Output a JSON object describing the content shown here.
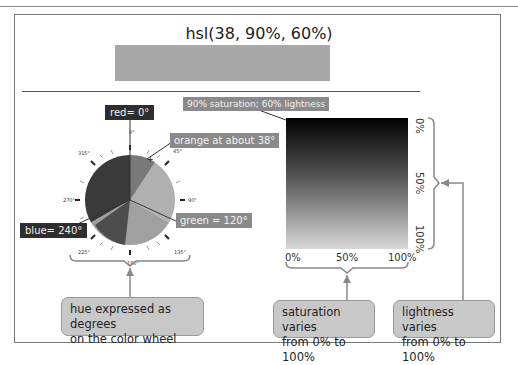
{
  "figure": {
    "title": "hsl(38, 90%, 60%)",
    "swatch_color": "#a8a8a8"
  },
  "wheel": {
    "labels": {
      "red": "red= 0°",
      "orange": "orange at about 38°",
      "green": "green = 120°",
      "blue": "blue= 240°"
    },
    "ticks": [
      "0°",
      "45°",
      "90°",
      "135°",
      "180°",
      "225°",
      "270°",
      "315°"
    ]
  },
  "square": {
    "label": "90% saturation; 60% lightness",
    "x_ticks": [
      "0%",
      "50%",
      "100%"
    ],
    "y_ticks": [
      "0%",
      "50%",
      "100%"
    ]
  },
  "callouts": {
    "hue": [
      "hue expressed as degrees",
      "on the color wheel"
    ],
    "saturation": [
      "saturation varies",
      "from 0% to 100%"
    ],
    "lightness": [
      "lightness varies",
      "from 0% to 100%"
    ]
  }
}
